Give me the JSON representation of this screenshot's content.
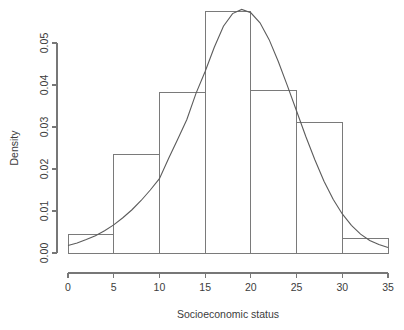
{
  "chart_data": {
    "type": "bar",
    "title": "",
    "subtitle": "",
    "xlabel": "Socioeconomic status",
    "ylabel": "Density",
    "xlim": [
      0,
      35
    ],
    "ylim": [
      0,
      0.05
    ],
    "grid": false,
    "legend": null,
    "bin_width": 5,
    "categories": [
      "0-5",
      "5-10",
      "10-15",
      "15-20",
      "20-25",
      "25-30",
      "30-35"
    ],
    "bin_edges": [
      0,
      5,
      10,
      15,
      20,
      25,
      30,
      35
    ],
    "values": [
      0.0045,
      0.0235,
      0.0381,
      0.0574,
      0.0388,
      0.031,
      0.0035
    ],
    "xticks": [
      0,
      5,
      10,
      15,
      20,
      25,
      30,
      35
    ],
    "xtick_labels": [
      "0",
      "5",
      "10",
      "15",
      "20",
      "25",
      "30",
      "35"
    ],
    "yticks": [
      0,
      0.01,
      0.02,
      0.03,
      0.04,
      0.05
    ],
    "ytick_labels": [
      "0.00",
      "0.01",
      "0.02",
      "0.03",
      "0.04",
      "0.05"
    ],
    "overlay": {
      "type": "line",
      "name": "density curve",
      "mean": 18.4,
      "sd": 6.9,
      "peak_y": 0.058,
      "x": [
        0,
        1,
        2,
        3,
        4,
        5,
        6,
        7,
        8,
        9,
        10,
        11,
        12,
        13,
        14,
        15,
        16,
        17,
        18,
        19,
        20,
        21,
        22,
        23,
        24,
        25,
        26,
        27,
        28,
        29,
        30,
        31,
        32,
        33,
        34,
        35
      ],
      "y": [
        0.0018,
        0.0024,
        0.0032,
        0.0041,
        0.0053,
        0.0067,
        0.0084,
        0.0103,
        0.0125,
        0.015,
        0.0177,
        0.0225,
        0.0271,
        0.0318,
        0.038,
        0.0432,
        0.049,
        0.054,
        0.057,
        0.058,
        0.0572,
        0.0548,
        0.0508,
        0.0456,
        0.0398,
        0.0338,
        0.0278,
        0.0222,
        0.0171,
        0.0128,
        0.0093,
        0.0066,
        0.0045,
        0.003,
        0.002,
        0.0013
      ]
    }
  },
  "axis": {
    "x_title": "Socioeconomic status",
    "y_title": "Density"
  },
  "colors": {
    "background": "#ffffff",
    "axis": "#777777",
    "bar_stroke": "#7a7a7a",
    "curve": "#5c5c5c",
    "text": "#3c3c3c"
  }
}
